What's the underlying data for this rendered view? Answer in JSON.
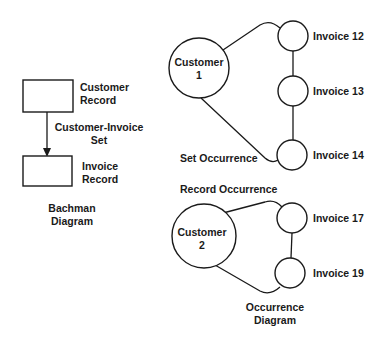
{
  "bachman": {
    "customer_record": [
      "Customer",
      "Record"
    ],
    "set_label": [
      "Customer-Invoice",
      "Set"
    ],
    "invoice_record": [
      "Invoice",
      "Record"
    ],
    "caption": [
      "Bachman",
      "Diagram"
    ]
  },
  "occurrence": {
    "owners": [
      {
        "name": [
          "Customer",
          "1"
        ],
        "invoices": [
          "Invoice 12",
          "Invoice 13",
          "Invoice 14"
        ]
      },
      {
        "name": [
          "Customer",
          "2"
        ],
        "invoices": [
          "Invoice 17",
          "Invoice 19"
        ]
      }
    ],
    "set_occurrence_label": "Set Occurrence",
    "record_occurrence_label": "Record Occurrence",
    "caption": [
      "Occurrence",
      "Diagram"
    ]
  },
  "colors": {
    "ink": "#1a1a1a",
    "background": "#ffffff"
  }
}
